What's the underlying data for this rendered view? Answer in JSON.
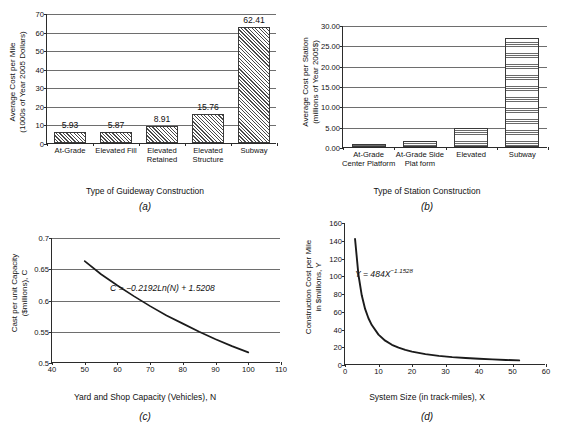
{
  "figure": {
    "panels": [
      "a",
      "b",
      "c",
      "d"
    ]
  },
  "chart_data": [
    {
      "id": "a",
      "type": "bar",
      "panel_label": "(a)",
      "title": "",
      "xlabel": "Type of Guideway Construction",
      "ylabel_line1": "Average Cost per Mile",
      "ylabel_line2": "(1000s of Year 2005 Dollars)",
      "categories": [
        "At-Grade",
        "Elevated Fill",
        "Elevated Retained",
        "Elevated Structure",
        "Subway"
      ],
      "category_lines": [
        [
          "At-Grade"
        ],
        [
          "Elevated Fill"
        ],
        [
          "Elevated",
          "Retained"
        ],
        [
          "Elevated",
          "Structure"
        ],
        [
          "Subway"
        ]
      ],
      "values": [
        5.93,
        5.87,
        8.91,
        15.76,
        62.41
      ],
      "data_labels": [
        "5.93",
        "5.87",
        "8.91",
        "15.76",
        "62.41"
      ],
      "yticks": [
        0,
        10,
        20,
        30,
        40,
        50,
        60,
        70
      ],
      "ytick_labels": [
        "0",
        "10",
        "20",
        "30",
        "40",
        "50",
        "60",
        "70"
      ],
      "ylim": [
        0,
        70
      ],
      "grid": true,
      "legend": "none",
      "fill": "diagonal-hatch"
    },
    {
      "id": "b",
      "type": "bar",
      "panel_label": "(b)",
      "title": "",
      "xlabel": "Type of Station Construction",
      "ylabel_line1": "Average Cost per Station",
      "ylabel_line2": "(millions of Year 2005$)",
      "categories": [
        "At-Grade Center Platform",
        "At-Grade Side Plat form",
        "Elevated",
        "Subway"
      ],
      "category_lines": [
        [
          "At-Grade",
          "Center Platform"
        ],
        [
          "At-Grade Side",
          "Plat form"
        ],
        [
          "Elevated"
        ],
        [
          "Subway"
        ]
      ],
      "values": [
        0.85,
        1.4,
        4.6,
        26.8
      ],
      "yticks": [
        0,
        5,
        10,
        15,
        20,
        25,
        30
      ],
      "ytick_labels": [
        "0.00",
        "5.00",
        "10.00",
        "15.00",
        "20.00",
        "25.00",
        "30.00"
      ],
      "ylim": [
        0,
        30
      ],
      "grid": true,
      "legend": "none",
      "fill": "dot-grid"
    },
    {
      "id": "c",
      "type": "line",
      "panel_label": "(c)",
      "title": "",
      "xlabel": "Yard and Shop Capacity (Vehicles), N",
      "ylabel_line1": "Cast per unit Capacity",
      "ylabel_line2": "($millions), C",
      "annotation": "C = −0.2192Ln(N) + 1.5208",
      "xticks": [
        40,
        50,
        60,
        70,
        80,
        90,
        100,
        110
      ],
      "xtick_labels": [
        "40",
        "50",
        "60",
        "70",
        "80",
        "90",
        "100",
        "110"
      ],
      "yticks": [
        0.5,
        0.55,
        0.6,
        0.65,
        0.7
      ],
      "ytick_labels": [
        "0.5",
        "0.55",
        "0.6",
        "0.65",
        "0.7"
      ],
      "xlim": [
        40,
        110
      ],
      "ylim": [
        0.5,
        0.7
      ],
      "grid": true,
      "legend": "none",
      "x": [
        50,
        55,
        60,
        65,
        70,
        75,
        80,
        85,
        90,
        95,
        100
      ],
      "y": [
        0.663,
        0.642,
        0.624,
        0.607,
        0.591,
        0.576,
        0.563,
        0.55,
        0.538,
        0.527,
        0.517
      ]
    },
    {
      "id": "d",
      "type": "line",
      "panel_label": "(d)",
      "title": "",
      "xlabel": "System Size (in track-miles), X",
      "ylabel_line1": "Construction Cost per Mile",
      "ylabel_line2": "in $millions, Y",
      "annotation_prefix": "Y = 484X",
      "annotation_exponent": "−1.1528",
      "xticks": [
        0,
        10,
        20,
        30,
        40,
        50,
        60
      ],
      "xtick_labels": [
        "0",
        "10",
        "20",
        "30",
        "40",
        "50",
        "60"
      ],
      "yticks": [
        0,
        20,
        40,
        60,
        80,
        100,
        120,
        140,
        160
      ],
      "ytick_labels": [
        "0",
        "20",
        "40",
        "60",
        "80",
        "100",
        "120",
        "140",
        "160"
      ],
      "xlim": [
        0,
        60
      ],
      "ylim": [
        0,
        160
      ],
      "grid": false,
      "legend": "none",
      "x": [
        3,
        4,
        5,
        6,
        7,
        8,
        10,
        12,
        14,
        16,
        18,
        20,
        24,
        28,
        32,
        36,
        40,
        44,
        48,
        52
      ],
      "y": [
        142,
        102,
        78.5,
        63.2,
        52.7,
        45.0,
        34.2,
        27.4,
        22.8,
        19.5,
        17.0,
        15.1,
        12.3,
        10.3,
        8.9,
        7.9,
        7.0,
        6.3,
        5.7,
        5.2
      ]
    }
  ]
}
